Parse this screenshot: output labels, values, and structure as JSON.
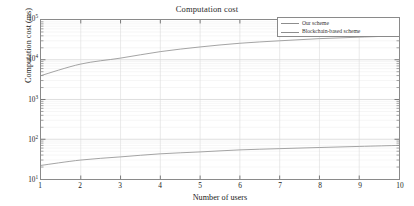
{
  "chart_data": {
    "type": "line",
    "title": "Computation cost",
    "xlabel": "Number of users",
    "ylabel": "Computation cost (ms)",
    "xlim": [
      1,
      10
    ],
    "ylim": [
      10,
      100000
    ],
    "yscale": "log",
    "xscale": "linear",
    "grid": true,
    "legend_position": "top-right",
    "x": [
      1,
      2,
      3,
      4,
      5,
      6,
      7,
      8,
      9,
      10
    ],
    "xticks": [
      "1",
      "2",
      "3",
      "4",
      "5",
      "6",
      "7",
      "8",
      "9",
      "10"
    ],
    "yticks": [
      {
        "value": 10,
        "mantissa": "10",
        "exponent": "1"
      },
      {
        "value": 100,
        "mantissa": "10",
        "exponent": "2"
      },
      {
        "value": 1000,
        "mantissa": "10",
        "exponent": "3"
      },
      {
        "value": 10000,
        "mantissa": "10",
        "exponent": "4"
      },
      {
        "value": 100000,
        "mantissa": "10",
        "exponent": "5"
      }
    ],
    "series": [
      {
        "name": "Our scheme",
        "color": "#8d8d8d",
        "values": [
          22,
          30,
          36,
          43,
          48,
          54,
          58,
          62,
          66,
          70
        ]
      },
      {
        "name": "Blockchain-based scheme",
        "color": "#8d8d8d",
        "values": [
          4000,
          7800,
          11000,
          16000,
          21000,
          26000,
          30000,
          34000,
          37000,
          40000
        ]
      }
    ]
  }
}
